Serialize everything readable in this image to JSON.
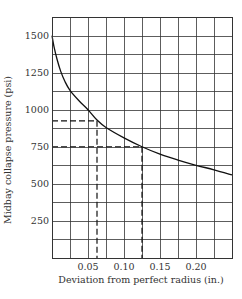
{
  "chart_data": {
    "type": "line",
    "title": "",
    "xlabel": "Deviation from perfect radius (in.)",
    "ylabel": "Midbay collapse pressure (psi)",
    "xlim": [
      0,
      0.25
    ],
    "ylim": [
      0,
      1625
    ],
    "x_grid_step": 0.025,
    "y_grid_step": 125,
    "grid": true,
    "legend": null,
    "x_ticks": [
      0.05,
      0.1,
      0.15,
      0.2
    ],
    "x_tick_labels": [
      "0.05",
      "0.10",
      "0.15",
      "0.20"
    ],
    "y_ticks": [
      250,
      500,
      750,
      1000,
      1250,
      1500
    ],
    "y_tick_labels": [
      "250",
      "500",
      "750",
      "1000",
      "1250",
      "1500"
    ],
    "series": [
      {
        "name": "Midbay collapse pressure",
        "x": [
          0.0,
          0.003,
          0.007,
          0.012,
          0.018,
          0.025,
          0.0375,
          0.05,
          0.0625,
          0.075,
          0.1,
          0.125,
          0.15,
          0.175,
          0.2,
          0.225,
          0.25
        ],
        "y": [
          1500,
          1420,
          1340,
          1260,
          1190,
          1130,
          1060,
          1000,
          930,
          880,
          810,
          750,
          700,
          660,
          625,
          595,
          560
        ]
      }
    ],
    "annotations": [
      {
        "type": "dashed-guide",
        "x": 0.0625,
        "y": 925,
        "description": "horizontal dashed line from y-axis to curve, vertical dashed line down to x-axis"
      },
      {
        "type": "dashed-guide",
        "x": 0.125,
        "y": 750,
        "description": "horizontal dashed line from y-axis to curve, vertical dashed line down to x-axis"
      }
    ]
  },
  "colors": {
    "grid": "#333333",
    "curve": "#111111",
    "text": "#333333",
    "background": "#ffffff"
  }
}
